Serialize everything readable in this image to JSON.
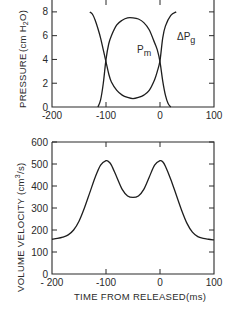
{
  "chart_data": [
    {
      "type": "line",
      "ylabel_main": "PRESSURE",
      "ylabel_unit": "(cm H",
      "ylabel_unit_sub": "2",
      "ylabel_unit_end": "O)",
      "xlim": [
        -200,
        100
      ],
      "ylim": [
        0,
        9
      ],
      "x_ticks": [
        -200,
        -100,
        0,
        100
      ],
      "x_tick_labels": [
        "-200",
        "-100",
        "0",
        "100"
      ],
      "y_ticks": [
        0,
        2,
        4,
        6,
        8
      ],
      "y_tick_labels": [
        "0",
        "2",
        "4",
        "6",
        "8"
      ],
      "grid": false,
      "series": [
        {
          "name": "Pm",
          "label_main": "P",
          "label_sub": "m",
          "x": [
            -115,
            -110,
            -105,
            -100,
            -95,
            -90,
            -80,
            -70,
            -60,
            -50,
            -40,
            -30,
            -20,
            -10,
            -5,
            0,
            5,
            10,
            15,
            20
          ],
          "y": [
            0.0,
            0.6,
            2.0,
            4.0,
            5.3,
            6.0,
            6.9,
            7.3,
            7.5,
            7.5,
            7.4,
            7.1,
            6.5,
            5.4,
            4.8,
            3.8,
            2.2,
            1.0,
            0.3,
            0.0
          ]
        },
        {
          "name": "ΔPg",
          "label_main": "ΔP",
          "label_sub": "g",
          "x": [
            -130,
            -125,
            -120,
            -115,
            -110,
            -105,
            -100,
            -95,
            -90,
            -80,
            -70,
            -60,
            -50,
            -40,
            -30,
            -20,
            -10,
            -5,
            0,
            5,
            10,
            20,
            30
          ],
          "y": [
            8.0,
            7.8,
            7.3,
            6.6,
            5.8,
            4.8,
            3.8,
            2.8,
            2.1,
            1.4,
            1.0,
            0.8,
            0.7,
            0.8,
            1.0,
            1.4,
            2.3,
            3.0,
            3.9,
            5.8,
            6.8,
            7.7,
            8.0
          ]
        }
      ]
    },
    {
      "type": "line",
      "ylabel_main": "VOLUME VELOCITY",
      "ylabel_unit": "(cm",
      "ylabel_unit_sup": "3",
      "ylabel_unit_end": "/s)",
      "xlabel": "TIME FROM RELEASED(ms)",
      "xlim": [
        -200,
        100
      ],
      "ylim": [
        0,
        600
      ],
      "x_ticks": [
        -200,
        -100,
        0,
        100
      ],
      "x_tick_labels": [
        "- 200",
        "-100",
        "0",
        "100"
      ],
      "y_ticks": [
        0,
        100,
        200,
        300,
        400,
        500,
        600
      ],
      "y_tick_labels": [
        "0",
        "100",
        "200",
        "300",
        "400",
        "500",
        "600"
      ],
      "grid": false,
      "series": [
        {
          "name": "Volume velocity",
          "x": [
            -200,
            -190,
            -180,
            -170,
            -160,
            -150,
            -140,
            -130,
            -120,
            -110,
            -100,
            -95,
            -90,
            -80,
            -70,
            -60,
            -50,
            -40,
            -30,
            -20,
            -10,
            0,
            5,
            10,
            20,
            30,
            40,
            50,
            60,
            70,
            80,
            90,
            100
          ],
          "y": [
            158,
            162,
            168,
            178,
            200,
            240,
            300,
            370,
            440,
            495,
            515,
            510,
            495,
            440,
            385,
            355,
            348,
            355,
            385,
            440,
            495,
            515,
            510,
            490,
            430,
            360,
            290,
            230,
            190,
            170,
            162,
            158,
            155
          ]
        }
      ]
    }
  ]
}
